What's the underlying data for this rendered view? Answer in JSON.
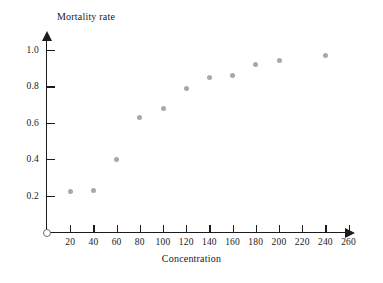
{
  "chart_data": {
    "type": "scatter",
    "title": "",
    "xlabel": "Concentration",
    "ylabel": "Mortality rate",
    "xlim": [
      0,
      270
    ],
    "ylim": [
      0,
      1.05
    ],
    "grid": false,
    "legend": false,
    "point_color": "#a8a8a8",
    "axis_color": "#1c1c1c",
    "x_ticks": [
      20,
      40,
      60,
      80,
      100,
      120,
      140,
      160,
      180,
      200,
      220,
      240,
      260
    ],
    "x_tick_labels": [
      "20",
      "40",
      "60",
      "80",
      "100",
      "120",
      "140",
      "160",
      "180",
      "200",
      "220",
      "240",
      "260"
    ],
    "y_ticks": [
      0.2,
      0.4,
      0.6,
      0.8,
      1.0
    ],
    "y_tick_labels": [
      "0.2",
      "0.4",
      "0.6",
      "0.8",
      "1.0"
    ],
    "x": [
      20,
      40,
      60,
      80,
      100,
      120,
      140,
      160,
      180,
      200,
      240
    ],
    "y": [
      0.22,
      0.23,
      0.4,
      0.63,
      0.68,
      0.79,
      0.85,
      0.86,
      0.92,
      0.94,
      0.97
    ],
    "points": [
      {
        "x": 20,
        "y": 0.22
      },
      {
        "x": 40,
        "y": 0.23
      },
      {
        "x": 60,
        "y": 0.4
      },
      {
        "x": 80,
        "y": 0.63
      },
      {
        "x": 100,
        "y": 0.68
      },
      {
        "x": 120,
        "y": 0.79
      },
      {
        "x": 140,
        "y": 0.85
      },
      {
        "x": 160,
        "y": 0.86
      },
      {
        "x": 180,
        "y": 0.92
      },
      {
        "x": 200,
        "y": 0.94
      },
      {
        "x": 240,
        "y": 0.97
      }
    ]
  }
}
